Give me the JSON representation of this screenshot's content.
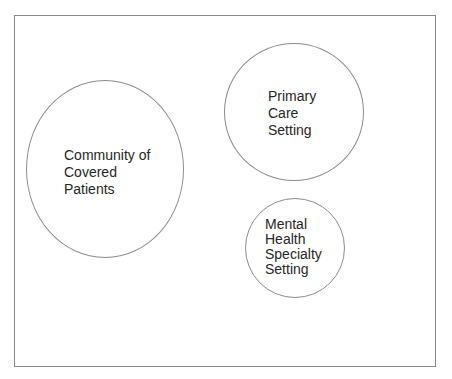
{
  "diagram": {
    "type": "venn-like-sets",
    "frame": {
      "border_color": "#8a8a8a"
    },
    "circles": [
      {
        "id": "community",
        "lines": [
          "Community of",
          "Covered",
          "Patients"
        ]
      },
      {
        "id": "primary-care",
        "lines": [
          "Primary",
          "Care",
          "Setting"
        ]
      },
      {
        "id": "mental-health",
        "lines": [
          "Mental",
          "Health",
          "Specialty",
          "Setting"
        ]
      }
    ]
  }
}
